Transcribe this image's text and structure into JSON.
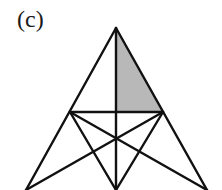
{
  "figure": {
    "label": "(c)",
    "colors": {
      "stroke": "#111111",
      "shade": "#b8b8b8",
      "background": "#ffffff"
    },
    "points": {
      "apex": [
        116,
        28
      ],
      "left_mid": [
        70,
        112
      ],
      "right_mid": [
        163,
        112
      ],
      "center": [
        116,
        140
      ],
      "bottom_left": [
        26,
        190
      ],
      "bottom_center": [
        116,
        190
      ],
      "bottom_right": [
        207,
        190
      ]
    },
    "shaded_region": "triangle apex - right_mid - (116,112)"
  }
}
